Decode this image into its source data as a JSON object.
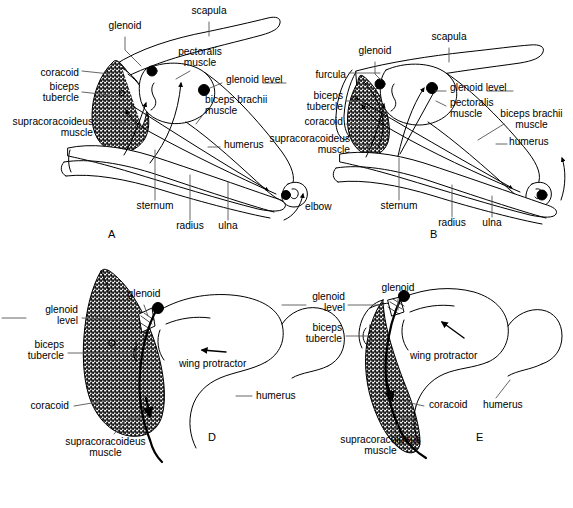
{
  "figure": {
    "type": "anatomical-line-diagram",
    "panel_count": 4,
    "stroke_color": "#000000",
    "fill_stipple_color": "#9a9a9a",
    "background": "#ffffff"
  },
  "panels": [
    {
      "letter": "A",
      "letter_x": 110,
      "letter_y": 234,
      "labels": [
        {
          "text": "scapula",
          "x": 209,
          "y": 11,
          "align": "center"
        },
        {
          "text": "glenoid",
          "x": 125,
          "y": 26,
          "align": "center"
        },
        {
          "text": "pectoralis\nmuscle",
          "x": 200,
          "y": 52,
          "align": "center"
        },
        {
          "text": "coracoid",
          "x": 78,
          "y": 73,
          "align": "right"
        },
        {
          "text": "glenoid level",
          "x": 224,
          "y": 80,
          "align": "left"
        },
        {
          "text": "biceps\ntubercle",
          "x": 78,
          "y": 87,
          "align": "right"
        },
        {
          "text": "biceps brachii\nmuscle",
          "x": 205,
          "y": 100,
          "align": "left"
        },
        {
          "text": "supracoracoideus\nmuscle",
          "x": 92,
          "y": 122,
          "align": "right"
        },
        {
          "text": "humerus",
          "x": 222,
          "y": 144,
          "align": "left"
        },
        {
          "text": "sternum",
          "x": 155,
          "y": 205,
          "align": "center"
        },
        {
          "text": "radius",
          "x": 190,
          "y": 225,
          "align": "center"
        },
        {
          "text": "ulna",
          "x": 228,
          "y": 225,
          "align": "center"
        },
        {
          "text": "elbow",
          "x": 305,
          "y": 206,
          "align": "left"
        }
      ]
    },
    {
      "letter": "B",
      "letter_x": 432,
      "letter_y": 234,
      "labels": [
        {
          "text": "scapula",
          "x": 449,
          "y": 37,
          "align": "center"
        },
        {
          "text": "glenoid",
          "x": 375,
          "y": 51,
          "align": "center"
        },
        {
          "text": "furcula",
          "x": 345,
          "y": 75,
          "align": "right"
        },
        {
          "text": "glenoid level",
          "x": 448,
          "y": 88,
          "align": "left"
        },
        {
          "text": "biceps\ntubercle",
          "x": 342,
          "y": 96,
          "align": "right"
        },
        {
          "text": "pectoralis\nmuscle",
          "x": 448,
          "y": 103,
          "align": "left"
        },
        {
          "text": "biceps brachii\nmuscle",
          "x": 494,
          "y": 114,
          "align": "left"
        },
        {
          "text": "coracoid",
          "x": 342,
          "y": 121,
          "align": "right"
        },
        {
          "text": "supracoracoideus\nmuscle",
          "x": 349,
          "y": 139,
          "align": "right"
        },
        {
          "text": "humerus",
          "x": 509,
          "y": 141,
          "align": "left"
        },
        {
          "text": "sternum",
          "x": 399,
          "y": 205,
          "align": "center"
        },
        {
          "text": "radius",
          "x": 452,
          "y": 222,
          "align": "center"
        },
        {
          "text": "ulna",
          "x": 492,
          "y": 222,
          "align": "center"
        }
      ]
    },
    {
      "letter": "D",
      "letter_x": 211,
      "letter_y": 437,
      "labels": [
        {
          "text": "glenoid",
          "x": 144,
          "y": 294,
          "align": "center"
        },
        {
          "text": "glenoid\nlevel",
          "x": 77,
          "y": 315,
          "align": "right"
        },
        {
          "text": "biceps\ntubercle",
          "x": 63,
          "y": 350,
          "align": "right"
        },
        {
          "text": "wing protractor",
          "x": 179,
          "y": 363,
          "align": "left"
        },
        {
          "text": "humerus",
          "x": 258,
          "y": 393,
          "align": "left"
        },
        {
          "text": "coracoid",
          "x": 68,
          "y": 403,
          "align": "right"
        },
        {
          "text": "supracoracoideus\nmuscle",
          "x": 105,
          "y": 442,
          "align": "center"
        }
      ]
    },
    {
      "letter": "E",
      "letter_x": 478,
      "letter_y": 437,
      "labels": [
        {
          "text": "glenoid",
          "x": 398,
          "y": 288,
          "align": "center"
        },
        {
          "text": "glenoid\nlevel",
          "x": 343,
          "y": 302,
          "align": "right"
        },
        {
          "text": "biceps\ntubercle",
          "x": 340,
          "y": 333,
          "align": "right"
        },
        {
          "text": "wing protractor",
          "x": 412,
          "y": 355,
          "align": "left"
        },
        {
          "text": "coracoid",
          "x": 429,
          "y": 403,
          "align": "left"
        },
        {
          "text": "humerus",
          "x": 483,
          "y": 404,
          "align": "left"
        },
        {
          "text": "supracoracoideus\nmuscle",
          "x": 380,
          "y": 440,
          "align": "center"
        }
      ]
    }
  ]
}
